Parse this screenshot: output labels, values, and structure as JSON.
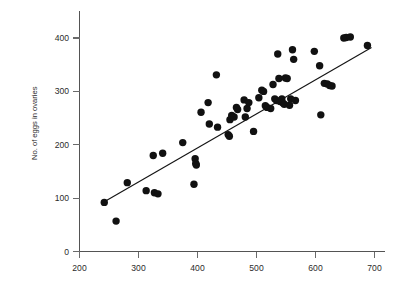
{
  "chart_data": {
    "type": "scatter",
    "title": "",
    "xlabel": "",
    "ylabel": "No. of eggs in ovaries",
    "xlim": [
      200,
      710
    ],
    "ylim": [
      0,
      430
    ],
    "xticks": [
      200,
      300,
      400,
      500,
      600,
      700
    ],
    "yticks": [
      0,
      100,
      200,
      300,
      400
    ],
    "xtick_labels": [
      "200",
      "300",
      "400",
      "500",
      "600",
      "700"
    ],
    "ytick_labels": [
      "0",
      "100",
      "200",
      "300",
      "400"
    ],
    "grid": false,
    "legend": null,
    "marker": {
      "shape": "circle",
      "color": "#111111",
      "size": 4.6
    },
    "series": [
      {
        "name": "observations",
        "points": [
          [
            242,
            92
          ],
          [
            262,
            57
          ],
          [
            281,
            129
          ],
          [
            313,
            114
          ],
          [
            325,
            180
          ],
          [
            327,
            110
          ],
          [
            333,
            108
          ],
          [
            341,
            184
          ],
          [
            375,
            204
          ],
          [
            394,
            126
          ],
          [
            396,
            174
          ],
          [
            397,
            165
          ],
          [
            398,
            162
          ],
          [
            406,
            261
          ],
          [
            418,
            279
          ],
          [
            420,
            239
          ],
          [
            432,
            331
          ],
          [
            434,
            233
          ],
          [
            452,
            219
          ],
          [
            454,
            216
          ],
          [
            455,
            247
          ],
          [
            458,
            255
          ],
          [
            462,
            252
          ],
          [
            466,
            270
          ],
          [
            468,
            266
          ],
          [
            479,
            284
          ],
          [
            481,
            252
          ],
          [
            484,
            268
          ],
          [
            487,
            279
          ],
          [
            495,
            225
          ],
          [
            504,
            288
          ],
          [
            509,
            302
          ],
          [
            512,
            300
          ],
          [
            515,
            273
          ],
          [
            518,
            270
          ],
          [
            524,
            268
          ],
          [
            528,
            313
          ],
          [
            531,
            286
          ],
          [
            534,
            283
          ],
          [
            536,
            370
          ],
          [
            538,
            324
          ],
          [
            540,
            281
          ],
          [
            543,
            286
          ],
          [
            545,
            278
          ],
          [
            547,
            276
          ],
          [
            549,
            325
          ],
          [
            552,
            324
          ],
          [
            556,
            274
          ],
          [
            558,
            286
          ],
          [
            561,
            378
          ],
          [
            563,
            360
          ],
          [
            566,
            283
          ],
          [
            598,
            375
          ],
          [
            607,
            348
          ],
          [
            609,
            256
          ],
          [
            615,
            315
          ],
          [
            620,
            314
          ],
          [
            624,
            311
          ],
          [
            628,
            310
          ],
          [
            648,
            400
          ],
          [
            652,
            401
          ],
          [
            659,
            402
          ],
          [
            688,
            386
          ]
        ]
      }
    ],
    "fit_line": {
      "name": "regression-line",
      "x_start": 242,
      "y_start": 93,
      "x_end": 695,
      "y_end": 382
    }
  }
}
